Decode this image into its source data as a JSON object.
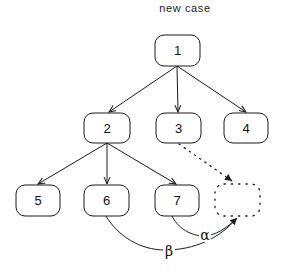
{
  "title": "new case",
  "nodes": [
    {
      "id": "1",
      "label": "1",
      "x": 155,
      "y": 35,
      "w": 45,
      "h": 31
    },
    {
      "id": "2",
      "label": "2",
      "x": 84,
      "y": 113,
      "w": 46,
      "h": 30
    },
    {
      "id": "3",
      "label": "3",
      "x": 156,
      "y": 113,
      "w": 45,
      "h": 30
    },
    {
      "id": "4",
      "label": "4",
      "x": 224,
      "y": 113,
      "w": 44,
      "h": 30
    },
    {
      "id": "5",
      "label": "5",
      "x": 16,
      "y": 185,
      "w": 44,
      "h": 31
    },
    {
      "id": "6",
      "label": "6",
      "x": 84,
      "y": 185,
      "w": 45,
      "h": 31
    },
    {
      "id": "7",
      "label": "7",
      "x": 155,
      "y": 185,
      "w": 44,
      "h": 31
    }
  ],
  "new_node": {
    "label": "",
    "style": "dotted",
    "x": 215,
    "y": 184,
    "w": 45,
    "h": 32
  },
  "edges": [
    {
      "from": "1",
      "to": "2",
      "style": "solid"
    },
    {
      "from": "1",
      "to": "3",
      "style": "solid"
    },
    {
      "from": "1",
      "to": "4",
      "style": "solid"
    },
    {
      "from": "2",
      "to": "5",
      "style": "solid"
    },
    {
      "from": "2",
      "to": "6",
      "style": "solid"
    },
    {
      "from": "2",
      "to": "7",
      "style": "solid"
    },
    {
      "from": "3",
      "to": "new",
      "style": "dotted"
    },
    {
      "from": "7",
      "to": "new",
      "style": "curved",
      "label": "α"
    },
    {
      "from": "6",
      "to": "new",
      "style": "curved",
      "label": "β"
    }
  ],
  "edge_labels": {
    "alpha": "α",
    "beta": "β"
  },
  "colors": {
    "stroke": "#1a1a1a",
    "background": "#ffffff"
  }
}
